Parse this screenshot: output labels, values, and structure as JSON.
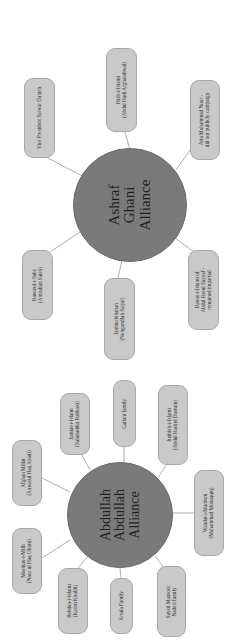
{
  "diagram": {
    "orientation": "rotated-90-ccw",
    "colors": {
      "background": "#ffffff",
      "hub_fill": "#7a7a7a",
      "node_fill": "#c9c9c9",
      "node_border": "#a9a9a9",
      "connector": "#9a9a9a"
    },
    "ghani": {
      "title": [
        "Ashraf",
        "Ghani",
        "Alliance"
      ],
      "nodes": [
        {
          "id": "sarwar-danish",
          "lines": [
            "Vice President Sarwar Danish"
          ]
        },
        {
          "id": "hizb-i-islami",
          "lines": [
            "Hizb-i-Islami",
            "(Abdul Hadi Arghandiwal)"
          ]
        },
        {
          "id": "atta-noor",
          "lines": [
            "Atta Mohammad Noor -",
            "did not publicly campaign"
          ]
        },
        {
          "id": "rawand-i-sabz",
          "lines": [
            "Rawand-i-Sabz",
            "(Amrullah Saleh)"
          ]
        },
        {
          "id": "jamhurikhahan",
          "lines": [
            "Jamhurikhahan",
            "(Nehgarullah Sarjar)"
          ]
        },
        {
          "id": "dawat-i-islami",
          "lines": [
            "Dawat-i-Islami of",
            "Abdul Rasul Sayyaf -",
            "remained impartial"
          ]
        }
      ]
    },
    "abdullah": {
      "title": [
        "Abdullah",
        "Abdullah",
        "Alliance"
      ],
      "nodes": [
        {
          "id": "afghan-millat",
          "lines": [
            "Afghan Millat",
            "(Anwarul Haq Ahadi)"
          ]
        },
        {
          "id": "jamiat-i-islami",
          "lines": [
            "Jamiat-i-Islami",
            "(Salahuddin Rabbani)"
          ]
        },
        {
          "id": "gailani-family",
          "lines": [
            "Gailani family"
          ]
        },
        {
          "id": "junbish-i-islami",
          "lines": [
            "Junbish-i-Islami",
            "(Abdul Rashid Dostum)"
          ]
        },
        {
          "id": "wahdat-i-mardom",
          "lines": [
            "Wahdat-i-Mardom",
            "(Mohammad Mohaqqiq)"
          ]
        },
        {
          "id": "mushtak-i-milli",
          "lines": [
            "Mushtak-i-Milli",
            "(Noor ul Haq Olomi)"
          ]
        },
        {
          "id": "rebdan-i-islami",
          "lines": [
            "Rebdan-i-Islami",
            "(Karim Khalili)"
          ]
        },
        {
          "id": "arsala-family",
          "lines": [
            "Arsala Family"
          ]
        },
        {
          "id": "naderi-family",
          "lines": [
            "Sayed Mansoor",
            "Naderi family"
          ]
        }
      ]
    }
  }
}
